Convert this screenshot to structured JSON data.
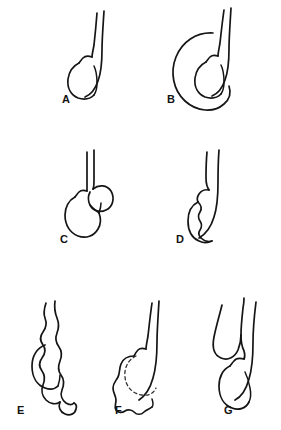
{
  "plate": {
    "title": "Scrotal and testicular abnormalities",
    "background_color": "#ffffff",
    "ink_color": "#151515",
    "dashed_color": "#303030",
    "width": 281,
    "height": 430,
    "style": "black-and-white line drawing"
  },
  "panels": [
    {
      "id": "a",
      "label": "A",
      "label_x": 62,
      "label_y": 103,
      "row": 1,
      "column": 1,
      "subject": "normal-testis-and-spermatic-cord",
      "features": [
        "spermatic cord",
        "epididymis head",
        "testis",
        "epididymis body along posterior border"
      ]
    },
    {
      "id": "b",
      "label": "B",
      "label_x": 167,
      "label_y": 103,
      "row": 1,
      "column": 2,
      "subject": "hydrocele",
      "features": [
        "large fluid sac surrounding testis",
        "spermatic cord",
        "testis displaced posteriorly"
      ]
    },
    {
      "id": "c",
      "label": "C",
      "label_x": 60,
      "label_y": 243,
      "row": 2,
      "column": 1,
      "subject": "spermatocele-or-epididymal-cyst",
      "features": [
        "round cyst above and behind testis",
        "spermatic cord",
        "testis"
      ]
    },
    {
      "id": "d",
      "label": "D",
      "label_x": 176,
      "label_y": 243,
      "row": 2,
      "column": 2,
      "subject": "epididymitis",
      "features": [
        "swollen nodular epididymis",
        "thickened cord",
        "testis"
      ]
    },
    {
      "id": "e",
      "label": "E",
      "label_x": 17,
      "label_y": 414,
      "row": 3,
      "column": 1,
      "subject": "varicocele",
      "features": [
        "dilated tortuous veins",
        "bag-of-worms appearance",
        "testis"
      ]
    },
    {
      "id": "f",
      "label": "F",
      "label_x": 115,
      "label_y": 414,
      "row": 3,
      "column": 2,
      "subject": "testicular-tumor",
      "features": [
        "irregular lobulated mass",
        "dashed outline of original testis",
        "spermatic cord"
      ]
    },
    {
      "id": "g",
      "label": "G",
      "label_x": 224,
      "label_y": 414,
      "row": 3,
      "column": 3,
      "subject": "inguinal-hernia-into-scrotum",
      "features": [
        "bowel loop descending beside cord",
        "spermatic cord",
        "testis"
      ]
    }
  ]
}
